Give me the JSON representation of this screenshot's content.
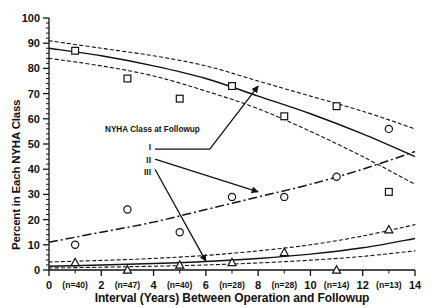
{
  "chart_data": {
    "type": "scatter",
    "title": "",
    "xlabel": "Interval (Years) Between Operation and Followup",
    "ylabel": "Percent in Each NYHA Class",
    "xlim": [
      0,
      14
    ],
    "ylim": [
      0,
      100
    ],
    "grid": false,
    "legend_position": "inside-left",
    "legend_title": "NYHA Class at Followup",
    "x_ticks": [
      "0",
      "2",
      "4",
      "6",
      "8",
      "10",
      "12",
      "14"
    ],
    "x_tick_values": [
      0,
      2,
      4,
      6,
      8,
      10,
      12,
      14
    ],
    "y_ticks": [
      "0",
      "10",
      "20",
      "30",
      "40",
      "50",
      "60",
      "70",
      "80",
      "90",
      "100"
    ],
    "y_tick_values": [
      0,
      10,
      20,
      30,
      40,
      50,
      60,
      70,
      80,
      90,
      100
    ],
    "n_labels": [
      {
        "label": "(n=40)",
        "x": 1
      },
      {
        "label": "(n=47)",
        "x": 3
      },
      {
        "label": "(n=40)",
        "x": 5
      },
      {
        "label": "(n=28)",
        "x": 7
      },
      {
        "label": "(n=28)",
        "x": 9
      },
      {
        "label": "(n=14)",
        "x": 11
      },
      {
        "label": "(n=13)",
        "x": 13
      }
    ],
    "series": [
      {
        "name": "I",
        "label": "I",
        "marker": "square",
        "line_style": "solid",
        "band_style": "dashed",
        "points": [
          {
            "x": 1.0,
            "y": 87
          },
          {
            "x": 3.0,
            "y": 76
          },
          {
            "x": 5.0,
            "y": 68
          },
          {
            "x": 7.0,
            "y": 73
          },
          {
            "x": 9.0,
            "y": 61
          },
          {
            "x": 11.0,
            "y": 65
          },
          {
            "x": 13.0,
            "y": 31
          }
        ],
        "fit": [
          {
            "x": 0,
            "y": 88
          },
          {
            "x": 2,
            "y": 85
          },
          {
            "x": 4,
            "y": 81
          },
          {
            "x": 6,
            "y": 76
          },
          {
            "x": 8,
            "y": 69
          },
          {
            "x": 10,
            "y": 62
          },
          {
            "x": 12,
            "y": 54
          },
          {
            "x": 14,
            "y": 45
          }
        ],
        "ci_upper": [
          {
            "x": 0,
            "y": 91
          },
          {
            "x": 2,
            "y": 88
          },
          {
            "x": 4,
            "y": 85
          },
          {
            "x": 6,
            "y": 81
          },
          {
            "x": 8,
            "y": 75
          },
          {
            "x": 10,
            "y": 69
          },
          {
            "x": 12,
            "y": 63
          },
          {
            "x": 14,
            "y": 56
          }
        ],
        "ci_lower": [
          {
            "x": 0,
            "y": 84
          },
          {
            "x": 2,
            "y": 81
          },
          {
            "x": 4,
            "y": 77
          },
          {
            "x": 6,
            "y": 71
          },
          {
            "x": 8,
            "y": 64
          },
          {
            "x": 10,
            "y": 55
          },
          {
            "x": 12,
            "y": 45
          },
          {
            "x": 14,
            "y": 34
          }
        ]
      },
      {
        "name": "II",
        "label": "II",
        "marker": "circle",
        "line_style": "dash-dot",
        "points": [
          {
            "x": 1.0,
            "y": 10
          },
          {
            "x": 3.0,
            "y": 24
          },
          {
            "x": 5.0,
            "y": 15
          },
          {
            "x": 7.0,
            "y": 29
          },
          {
            "x": 9.0,
            "y": 29
          },
          {
            "x": 11.0,
            "y": 37
          },
          {
            "x": 13.0,
            "y": 56
          }
        ],
        "fit": [
          {
            "x": 0,
            "y": 11
          },
          {
            "x": 2,
            "y": 15
          },
          {
            "x": 4,
            "y": 19
          },
          {
            "x": 6,
            "y": 24
          },
          {
            "x": 8,
            "y": 29
          },
          {
            "x": 10,
            "y": 34
          },
          {
            "x": 12,
            "y": 40
          },
          {
            "x": 14,
            "y": 47
          }
        ]
      },
      {
        "name": "III",
        "label": "III",
        "marker": "triangle",
        "line_style": "solid",
        "band_style": "dashed",
        "points": [
          {
            "x": 1.0,
            "y": 3
          },
          {
            "x": 3.0,
            "y": 0
          },
          {
            "x": 5.0,
            "y": 2
          },
          {
            "x": 7.0,
            "y": 3
          },
          {
            "x": 9.0,
            "y": 7
          },
          {
            "x": 11.0,
            "y": 0
          },
          {
            "x": 13.0,
            "y": 16
          }
        ],
        "fit": [
          {
            "x": 0,
            "y": 1.5
          },
          {
            "x": 2,
            "y": 2.0
          },
          {
            "x": 4,
            "y": 2.6
          },
          {
            "x": 6,
            "y": 3.4
          },
          {
            "x": 8,
            "y": 4.6
          },
          {
            "x": 10,
            "y": 6.3
          },
          {
            "x": 12,
            "y": 8.8
          },
          {
            "x": 14,
            "y": 12.5
          }
        ],
        "ci_upper": [
          {
            "x": 0,
            "y": 3.2
          },
          {
            "x": 2,
            "y": 3.8
          },
          {
            "x": 4,
            "y": 4.6
          },
          {
            "x": 6,
            "y": 5.8
          },
          {
            "x": 8,
            "y": 7.6
          },
          {
            "x": 10,
            "y": 10.0
          },
          {
            "x": 12,
            "y": 13.5
          },
          {
            "x": 14,
            "y": 18.0
          }
        ],
        "ci_lower": [
          {
            "x": 0,
            "y": 0.8
          },
          {
            "x": 2,
            "y": 1.1
          },
          {
            "x": 4,
            "y": 1.5
          },
          {
            "x": 6,
            "y": 2.0
          },
          {
            "x": 8,
            "y": 2.8
          },
          {
            "x": 10,
            "y": 3.9
          },
          {
            "x": 12,
            "y": 5.4
          },
          {
            "x": 14,
            "y": 7.6
          }
        ]
      }
    ],
    "annotations": [
      {
        "name": "arrow-class-i",
        "from": {
          "x": 6.15,
          "y": 48
        },
        "to": {
          "x": 8.0,
          "y": 73
        }
      },
      {
        "name": "arrow-class-ii",
        "from": {
          "x": 3.0,
          "y": 44
        },
        "to": {
          "x": 8.0,
          "y": 31
        }
      },
      {
        "name": "arrow-class-iii",
        "from": {
          "x": 2.85,
          "y": 40
        },
        "to": {
          "x": 6.0,
          "y": 3.5
        }
      }
    ],
    "colors": {
      "ink": "#111111",
      "background": "#ffffff"
    }
  }
}
